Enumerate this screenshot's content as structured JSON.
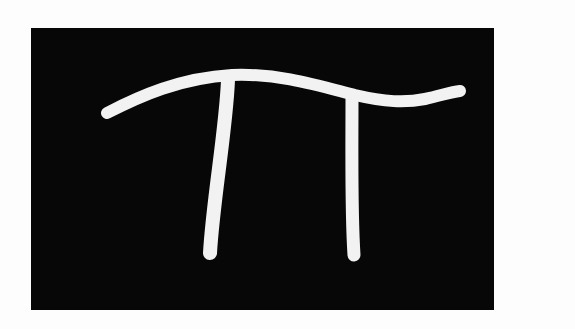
{
  "image": {
    "subject": "Handwritten pi symbol",
    "symbol": "π",
    "background_color": "#fdfdfd",
    "panel_color": "#070707",
    "stroke_color": "#f2f2f2"
  }
}
